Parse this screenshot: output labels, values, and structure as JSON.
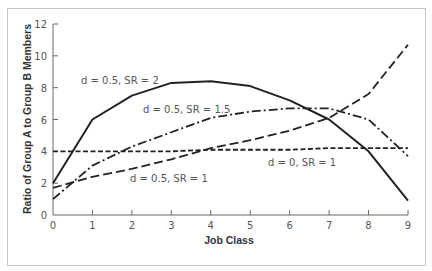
{
  "chart_data": {
    "type": "line",
    "title": "",
    "xlabel": "Job Class",
    "ylabel": "Ratio of Group A to Group B Members",
    "x": [
      0,
      1,
      2,
      3,
      4,
      5,
      6,
      7,
      8,
      9
    ],
    "xlim": [
      0,
      9
    ],
    "ylim": [
      0,
      12
    ],
    "xticks": [
      "0",
      "1",
      "2",
      "3",
      "4",
      "5",
      "6",
      "7",
      "8",
      "9"
    ],
    "yticks": [
      "0",
      "2",
      "4",
      "6",
      "8",
      "10",
      "12"
    ],
    "grid": false,
    "legend_position": "inline labels",
    "series": [
      {
        "name": "d = 0.5, SR = 2",
        "style": "solid",
        "values": [
          2.0,
          6.0,
          7.5,
          8.3,
          8.4,
          8.1,
          7.2,
          6.0,
          4.0,
          0.9
        ]
      },
      {
        "name": "d = 0.5, SR = 1.5",
        "style": "dash-dot",
        "values": [
          1.0,
          3.1,
          4.3,
          5.2,
          6.1,
          6.5,
          6.7,
          6.7,
          6.0,
          3.7
        ]
      },
      {
        "name": "d = 0.5, SR = 1",
        "style": "long-dash",
        "values": [
          1.7,
          2.4,
          2.9,
          3.5,
          4.2,
          4.7,
          5.3,
          6.1,
          7.6,
          10.7
        ]
      },
      {
        "name": "d = 0, SR = 1",
        "style": "short-dash",
        "values": [
          4.0,
          4.0,
          4.0,
          4.0,
          4.1,
          4.1,
          4.1,
          4.2,
          4.2,
          4.2
        ]
      }
    ]
  },
  "labels": {
    "sr2": "d = 0.5, SR = 2",
    "sr15": "d = 0.5, SR = 1.5",
    "sr1": "d = 0.5, SR = 1",
    "d0": "d = 0, SR = 1",
    "xlabel": "Job Class",
    "ylabel": "Ratio of Group A to Group B Members"
  },
  "ticks": {
    "x": [
      "0",
      "1",
      "2",
      "3",
      "4",
      "5",
      "6",
      "7",
      "8",
      "9"
    ],
    "y": [
      "0",
      "2",
      "4",
      "6",
      "8",
      "10",
      "12"
    ]
  },
  "colors": {
    "line": "#222222",
    "axis": "#666666",
    "text": "#555555",
    "frame": "#c8c8c8"
  }
}
